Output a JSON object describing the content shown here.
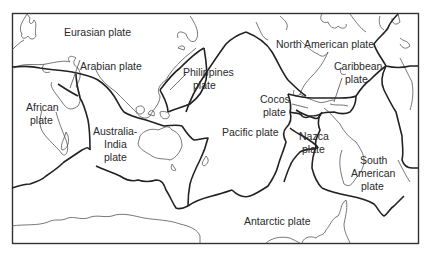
{
  "map": {
    "title": "Tectonic plates",
    "colors": {
      "background": "#ffffff",
      "boundary": "#222222",
      "coastline": "#555555",
      "text": "#2a2a2a"
    },
    "labels": {
      "eurasian": "Eurasian plate",
      "arabian": "Arabian plate",
      "african_1": "African",
      "african_2": "plate",
      "philippines_1": "Philippines",
      "philippines_2": "plate",
      "north_american": "North American plate",
      "caribbean_1": "Caribbean",
      "caribbean_2": "plate",
      "cocos_1": "Cocos",
      "cocos_2": "plate",
      "australia_1": "Australia-",
      "australia_2": "India",
      "australia_3": "plate",
      "pacific": "Pacific plate",
      "nazca_1": "Nazca",
      "nazca_2": "plate",
      "south_american_1": "South",
      "south_american_2": "American",
      "south_american_3": "plate",
      "antarctic": "Antarctic plate"
    }
  }
}
